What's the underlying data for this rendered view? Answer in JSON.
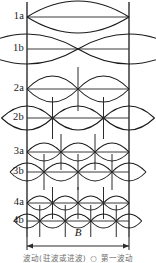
{
  "figure": {
    "type": "resonant-mode-pattern-diagram",
    "width_label": "B",
    "caption_partial": "波动(驻波或进波)  ○  第一波动",
    "rows": [
      {
        "label": "1a",
        "baseline_y": 17,
        "lobes": 1,
        "offset": false,
        "amplitude": 16,
        "show_verticals": false
      },
      {
        "label": "1b",
        "baseline_y": 49,
        "lobes": 2,
        "offset": true,
        "amplitude": 15,
        "show_verticals": false
      },
      {
        "label": "2a",
        "baseline_y": 89,
        "lobes": 2,
        "offset": false,
        "amplitude": 13,
        "show_verticals": true
      },
      {
        "label": "2b",
        "baseline_y": 118,
        "lobes": 3,
        "offset": true,
        "amplitude": 12,
        "show_verticals": true
      },
      {
        "label": "3a",
        "baseline_y": 152,
        "lobes": 3,
        "offset": false,
        "amplitude": 9,
        "show_verticals": true
      },
      {
        "label": "3b",
        "baseline_y": 172,
        "lobes": 4,
        "offset": true,
        "amplitude": 9,
        "show_verticals": true
      },
      {
        "label": "4a",
        "baseline_y": 203,
        "lobes": 4,
        "offset": false,
        "amplitude": 7,
        "show_verticals": true
      },
      {
        "label": "4b",
        "baseline_y": 221,
        "lobes": 5,
        "offset": true,
        "amplitude": 7,
        "show_verticals": true
      }
    ],
    "axis": {
      "left_x": 27,
      "right_x": 129,
      "top_y": 2,
      "bottom_y": 237,
      "arrow_y": 246,
      "b_label_y": 232
    },
    "colors": {
      "curve": "#1a1a1a",
      "axis": "#2b2b2b",
      "baseline": "#3a3a3a",
      "vertical": "#2b2b2b",
      "label": "#1a1a1a",
      "background": "#ffffff"
    }
  }
}
